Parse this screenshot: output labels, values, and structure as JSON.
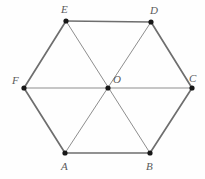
{
  "figure": {
    "kind": "geometry-diagram",
    "width": 205,
    "height": 179,
    "background_color": "#fefefe"
  },
  "style": {
    "outline_edge_color": "#6e6e6e",
    "outline_edge_width": 1.7,
    "diagonal_edge_color": "#8e8e8e",
    "diagonal_edge_width": 1.0,
    "vertex_dot_color": "#171717",
    "vertex_dot_radius": 2.6,
    "label_color": "#5a5a5a",
    "label_font_size": 11
  },
  "points": [
    {
      "id": "E",
      "label": "E",
      "x": 66,
      "y": 21,
      "label_x": 61,
      "label_y": 4,
      "role": "hexagon-vertex"
    },
    {
      "id": "D",
      "label": "D",
      "x": 151,
      "y": 22,
      "label_x": 150,
      "label_y": 5,
      "role": "hexagon-vertex"
    },
    {
      "id": "C",
      "label": "C",
      "x": 192,
      "y": 88,
      "label_x": 189,
      "label_y": 73,
      "role": "hexagon-vertex"
    },
    {
      "id": "B",
      "label": "B",
      "x": 150,
      "y": 153,
      "label_x": 146,
      "label_y": 161,
      "role": "hexagon-vertex"
    },
    {
      "id": "A",
      "label": "A",
      "x": 65,
      "y": 153,
      "label_x": 61,
      "label_y": 161,
      "role": "hexagon-vertex"
    },
    {
      "id": "F",
      "label": "F",
      "x": 24,
      "y": 88,
      "label_x": 12,
      "label_y": 75,
      "role": "hexagon-vertex"
    },
    {
      "id": "O",
      "label": "O",
      "x": 108,
      "y": 88,
      "label_x": 113,
      "label_y": 74,
      "role": "hexagon-center"
    }
  ],
  "edges": [
    {
      "id": "ED",
      "from": "E",
      "to": "D",
      "kind": "outline"
    },
    {
      "id": "DC",
      "from": "D",
      "to": "C",
      "kind": "outline"
    },
    {
      "id": "CB",
      "from": "C",
      "to": "B",
      "kind": "outline"
    },
    {
      "id": "BA",
      "from": "B",
      "to": "A",
      "kind": "outline"
    },
    {
      "id": "AF",
      "from": "A",
      "to": "F",
      "kind": "outline"
    },
    {
      "id": "FE",
      "from": "F",
      "to": "E",
      "kind": "outline"
    },
    {
      "id": "FC",
      "from": "F",
      "to": "C",
      "kind": "diagonal"
    },
    {
      "id": "EB",
      "from": "E",
      "to": "B",
      "kind": "diagonal"
    },
    {
      "id": "DA",
      "from": "D",
      "to": "A",
      "kind": "diagonal"
    }
  ]
}
